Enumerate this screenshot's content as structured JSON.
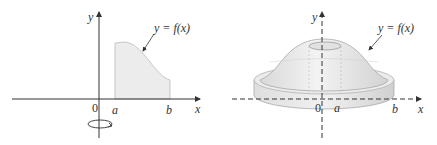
{
  "left_panel": {
    "y_axis_label": "y",
    "x_axis_label": "x",
    "origin_label": "0",
    "a_label": "a",
    "b_label": "b",
    "curve_label": "y = f(x)",
    "rotation_indicator": "rotation-arrow"
  },
  "right_panel": {
    "y_axis_label": "y",
    "x_axis_label": "x",
    "origin_label": "0",
    "a_label": "a",
    "b_label": "b",
    "curve_label": "y = f(x)"
  },
  "colors": {
    "axis": "#333333",
    "shade": "#ececec",
    "solid_light": "#f0f0f0",
    "solid_mid": "#dcdcdc",
    "solid_edge": "#bdbdbd"
  }
}
